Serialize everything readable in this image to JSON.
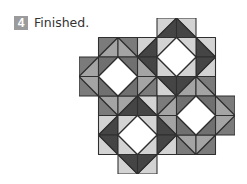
{
  "step": {
    "number": "4",
    "title": "Finished."
  },
  "quilt": {
    "grid": {
      "origin_x": 79,
      "origin_y": 18,
      "cell_px": 19.45,
      "cols": 8,
      "rows": 8
    },
    "colors": {
      "white": "#ffffff",
      "line": "#2f2f2f",
      "medium_center_corner": "#707070",
      "medium_goose": "#a4a4a4",
      "medium_goose_corner": "#7b7b7b",
      "dark_goose": "#454545",
      "light_corner": "#d3d3d3",
      "badge": "#9b9b9b"
    },
    "blocks": [
      {
        "name": "block-top-left",
        "cx": 2,
        "cy": 3,
        "palette": "medium"
      },
      {
        "name": "block-top-right",
        "cx": 5,
        "cy": 2,
        "palette": "dark"
      },
      {
        "name": "block-bottom-right",
        "cx": 6,
        "cy": 5,
        "palette": "medium"
      },
      {
        "name": "block-bottom-left",
        "cx": 3,
        "cy": 6,
        "palette": "dark"
      }
    ]
  }
}
